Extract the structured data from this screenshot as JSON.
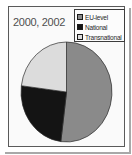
{
  "chart": {
    "title": "2000, 2002",
    "legend": {
      "items": [
        {
          "label": "EU-level",
          "color": "#8a8a8a"
        },
        {
          "label": "National",
          "color": "#141414"
        },
        {
          "label": "Transnational",
          "color": "#dcdcdc"
        }
      ]
    }
  },
  "chart_data": {
    "type": "pie",
    "title": "2000, 2002",
    "categories": [
      "EU-level",
      "National",
      "Transnational"
    ],
    "values": [
      52,
      25,
      23
    ],
    "unit": "percent",
    "colors": [
      "#8a8a8a",
      "#141414",
      "#dcdcdc"
    ],
    "start_angle_deg": 0,
    "direction": "clockwise",
    "legend_position": "top-right",
    "slice_outline_color": "#2b2b2b"
  }
}
